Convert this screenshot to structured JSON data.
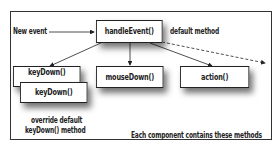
{
  "diagram": {
    "labels": {
      "new_event": "New event",
      "default_method": "default method",
      "override_line1": "override default",
      "override_line2": "keyDown() method",
      "caption": "Each component contains these methods"
    },
    "boxes": {
      "handle_event": "handleEvent()",
      "key_down_default": "keyDown()",
      "key_down_override": "keyDown()",
      "mouse_down": "mouseDown()",
      "action": "action()"
    },
    "edges": [
      {
        "from": "New event",
        "to": "handleEvent()",
        "style": "solid"
      },
      {
        "from": "handleEvent()",
        "to": "keyDown()",
        "style": "solid"
      },
      {
        "from": "handleEvent()",
        "to": "mouseDown()",
        "style": "solid"
      },
      {
        "from": "handleEvent()",
        "to": "action()",
        "style": "solid"
      },
      {
        "from": "handleEvent()",
        "to": "other methods",
        "style": "dashed"
      }
    ],
    "colors": {
      "line": "#222222",
      "background": "#ffffff"
    }
  }
}
